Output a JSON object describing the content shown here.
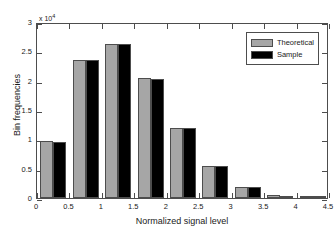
{
  "chart_data": {
    "type": "bar",
    "title": "",
    "xlabel": "Normalized signal level",
    "ylabel": "Bin frequencies",
    "y_exponent_label": "x 10",
    "y_exponent_power": "4",
    "y_scale": 10000,
    "xlim": [
      0,
      4.5
    ],
    "ylim": [
      0,
      30000
    ],
    "grid": false,
    "legend_position": "top-right",
    "xticks": [
      "0",
      "0.5",
      "1",
      "1.5",
      "2",
      "2.5",
      "3",
      "3.5",
      "4",
      "4.5"
    ],
    "xtick_values": [
      0,
      0.5,
      1,
      1.5,
      2,
      2.5,
      3,
      3.5,
      4,
      4.5
    ],
    "yticks": [
      "0",
      "0.5",
      "1",
      "1.5",
      "2",
      "2.5",
      "3"
    ],
    "ytick_values": [
      0,
      5000,
      10000,
      15000,
      20000,
      25000,
      30000
    ],
    "bin_centers": [
      0.25,
      0.75,
      1.25,
      1.75,
      2.25,
      2.75,
      3.25,
      3.75,
      4.25
    ],
    "bin_width": 0.5,
    "series": [
      {
        "name": "Theoretical",
        "color": "#a6a6a6",
        "values": [
          9700,
          23600,
          26300,
          20400,
          11900,
          5400,
          1950,
          430,
          60
        ]
      },
      {
        "name": "Sample",
        "color": "#000000",
        "values": [
          9600,
          23600,
          26300,
          20350,
          11850,
          5400,
          1950,
          420,
          55
        ]
      }
    ]
  },
  "legend": {
    "entries": [
      {
        "label": "Theoretical",
        "color": "#a6a6a6"
      },
      {
        "label": "Sample",
        "color": "#000000"
      }
    ]
  },
  "axes": {
    "x_title": "Normalized signal level",
    "y_title": "Bin frequencies",
    "exponent_prefix": "x 10",
    "exponent_power": "4"
  }
}
